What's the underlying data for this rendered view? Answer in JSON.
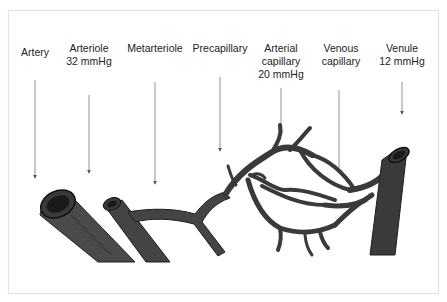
{
  "labels": [
    {
      "id": "artery",
      "lines": [
        "Artery"
      ],
      "x": 35,
      "y": 46
    },
    {
      "id": "arteriole",
      "lines": [
        "Arteriole",
        "32 mmHg"
      ],
      "x": 89,
      "y": 42
    },
    {
      "id": "metarteriole",
      "lines": [
        "Metarteriole"
      ],
      "x": 155,
      "y": 42
    },
    {
      "id": "precapillary",
      "lines": [
        "Precapillary"
      ],
      "x": 220,
      "y": 42
    },
    {
      "id": "arterial-capillary",
      "lines": [
        "Arterial",
        "capillary",
        "20 mmHg"
      ],
      "x": 281,
      "y": 42
    },
    {
      "id": "venous-capillary",
      "lines": [
        "Venous",
        "capillary"
      ],
      "x": 341,
      "y": 42
    },
    {
      "id": "venule",
      "lines": [
        "Venule",
        "12 mmHg"
      ],
      "x": 402,
      "y": 42
    }
  ],
  "arrows": [
    {
      "x": 35,
      "y1": 80,
      "y2": 180
    },
    {
      "x": 89,
      "y1": 95,
      "y2": 175
    },
    {
      "x": 155,
      "y1": 82,
      "y2": 186
    },
    {
      "x": 220,
      "y1": 77,
      "y2": 153
    },
    {
      "x": 281,
      "y1": 88,
      "y2": 136
    },
    {
      "x": 339,
      "y1": 90,
      "y2": 175
    },
    {
      "x": 402,
      "y1": 82,
      "y2": 116
    }
  ],
  "colors": {
    "vessel": "#3a3a3a",
    "vessel_dark": "#1e1e1e",
    "label": "#222222",
    "arrow": "#555555",
    "frame": "#e2e2e2"
  }
}
